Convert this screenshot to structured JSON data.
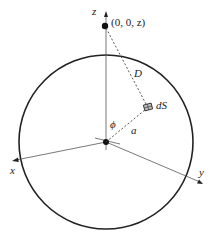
{
  "diagram": {
    "type": "spherical-shell-geometry",
    "labels": {
      "z_axis": "z",
      "x_axis": "x",
      "y_axis": "y",
      "point": "(0, 0, z)",
      "distance": "D",
      "surface_element": "dS",
      "angle": "ϕ",
      "radius": "a"
    },
    "colors": {
      "line": "#222222",
      "background": "#ffffff"
    },
    "geometry": {
      "center": [
        106,
        142
      ],
      "radius": 87,
      "point_on_z": [
        106,
        27
      ],
      "surface_element_pos": [
        147,
        106
      ]
    }
  }
}
